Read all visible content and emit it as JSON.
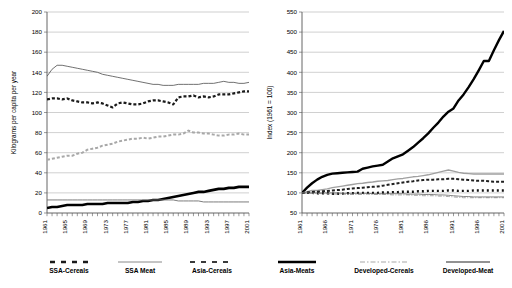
{
  "figure": {
    "background": "#ffffff",
    "panel_count": 2
  },
  "chart_data": [
    {
      "id": "left-chart",
      "type": "line",
      "title": "",
      "xlabel": "",
      "ylabel": "Kilograms per capita per year",
      "xlim": [
        1961,
        2001
      ],
      "ylim": [
        0,
        200
      ],
      "yticks": [
        0,
        20,
        40,
        60,
        80,
        100,
        120,
        140,
        160,
        180,
        200
      ],
      "xticks": [
        1961,
        1965,
        1969,
        1973,
        1977,
        1981,
        1985,
        1989,
        1993,
        1997,
        2001
      ],
      "grid": true,
      "legend_position": "below",
      "x": [
        1961,
        1962,
        1963,
        1964,
        1965,
        1966,
        1967,
        1968,
        1969,
        1970,
        1971,
        1972,
        1973,
        1974,
        1975,
        1976,
        1977,
        1978,
        1979,
        1980,
        1981,
        1982,
        1983,
        1984,
        1985,
        1986,
        1987,
        1988,
        1989,
        1990,
        1991,
        1992,
        1993,
        1994,
        1995,
        1996,
        1997,
        1998,
        1999,
        2000,
        2001
      ],
      "series": [
        {
          "name": "SSA-Cereals",
          "color": "#1a1a1a",
          "style": "dashed-thick",
          "width": 2.2,
          "dash": "3,2",
          "values": [
            113,
            114,
            114,
            113,
            114,
            112,
            111,
            110,
            110,
            109,
            110,
            109,
            107,
            105,
            109,
            110,
            109,
            108,
            108,
            109,
            111,
            112,
            112,
            111,
            110,
            108,
            115,
            116,
            116,
            117,
            115,
            116,
            115,
            116,
            118,
            118,
            118,
            119,
            120,
            121,
            121
          ]
        },
        {
          "name": "SSA Meat",
          "color": "#4d4d4d",
          "style": "solid-thin",
          "width": 0.8,
          "dash": "",
          "values": [
            136,
            143,
            147,
            147,
            146,
            145,
            144,
            143,
            142,
            141,
            140,
            138,
            137,
            136,
            135,
            134,
            133,
            132,
            131,
            130,
            129,
            128,
            128,
            127,
            127,
            127,
            128,
            128,
            128,
            128,
            128,
            129,
            129,
            129,
            130,
            131,
            130,
            130,
            129,
            129,
            130
          ]
        },
        {
          "name": "Asia-Cereals",
          "color": "#a8a8a8",
          "style": "dashed-med",
          "width": 2.0,
          "dash": "3,2",
          "values": [
            53,
            54,
            55,
            56,
            57,
            57,
            59,
            60,
            63,
            64,
            65,
            67,
            68,
            69,
            71,
            72,
            73,
            74,
            74,
            75,
            74,
            75,
            76,
            76,
            77,
            78,
            78,
            79,
            82,
            80,
            80,
            79,
            79,
            78,
            77,
            77,
            78,
            78,
            79,
            78,
            78
          ]
        },
        {
          "name": "Asia-Meats",
          "color": "#000000",
          "style": "solid-verythick",
          "width": 2.6,
          "dash": "",
          "values": [
            5,
            6,
            6,
            7,
            8,
            8,
            8,
            8,
            9,
            9,
            9,
            9,
            10,
            10,
            10,
            10,
            10,
            11,
            11,
            12,
            12,
            13,
            13,
            14,
            15,
            16,
            17,
            18,
            19,
            20,
            21,
            21,
            22,
            23,
            24,
            24,
            25,
            25,
            26,
            26,
            26
          ]
        },
        {
          "name": "Developed-Cereals",
          "color": "#6e6e6e",
          "style": "solid-thin",
          "width": 0.9,
          "dash": "",
          "values": [
            13,
            13,
            13,
            13,
            13,
            13,
            13,
            13,
            13,
            13,
            13,
            13,
            13,
            13,
            13,
            13,
            13,
            13,
            13,
            13,
            13,
            13,
            13,
            13,
            13,
            13,
            12,
            12,
            12,
            12,
            12,
            11,
            11,
            11,
            11,
            11,
            11,
            11,
            11,
            11,
            11
          ]
        }
      ],
      "legend": [
        {
          "label": "SSA-Cereals",
          "color": "#1a1a1a",
          "style": "dashed-thick"
        },
        {
          "label": "SSA Meat",
          "color": "#8a8a8a",
          "style": "solid-thin"
        },
        {
          "label": "Asia-Cereals",
          "color": "#3a3a3a",
          "style": "dashed-med"
        }
      ]
    },
    {
      "id": "right-chart",
      "type": "line",
      "title": "",
      "xlabel": "",
      "ylabel": "Index (1961 = 100)",
      "xlim": [
        1961,
        2001
      ],
      "ylim": [
        50,
        550
      ],
      "yticks": [
        50,
        100,
        150,
        200,
        250,
        300,
        350,
        400,
        450,
        500,
        550
      ],
      "xticks": [
        1961,
        1966,
        1971,
        1976,
        1981,
        1986,
        1991,
        1996,
        2001
      ],
      "grid": true,
      "legend_position": "below",
      "x": [
        1961,
        1962,
        1963,
        1964,
        1965,
        1966,
        1967,
        1968,
        1969,
        1970,
        1971,
        1972,
        1973,
        1974,
        1975,
        1976,
        1977,
        1978,
        1979,
        1980,
        1981,
        1982,
        1983,
        1984,
        1985,
        1986,
        1987,
        1988,
        1989,
        1990,
        1991,
        1992,
        1993,
        1994,
        1995,
        1996,
        1997,
        1998,
        1999,
        2000,
        2001
      ],
      "series": [
        {
          "name": "Asia-Meats",
          "color": "#000000",
          "style": "solid-verythick",
          "width": 2.4,
          "dash": "",
          "values": [
            100,
            113,
            124,
            133,
            140,
            145,
            148,
            149,
            150,
            151,
            152,
            153,
            160,
            163,
            166,
            168,
            170,
            178,
            186,
            191,
            196,
            205,
            214,
            225,
            236,
            248,
            262,
            275,
            290,
            302,
            310,
            330,
            345,
            363,
            383,
            405,
            428,
            428,
            455,
            480,
            503
          ]
        },
        {
          "name": "Developed-Meat",
          "color": "#a0a0a0",
          "style": "solid-med",
          "width": 1.4,
          "dash": "",
          "values": [
            100,
            103,
            106,
            106,
            108,
            110,
            113,
            115,
            117,
            119,
            121,
            123,
            124,
            126,
            127,
            129,
            130,
            131,
            133,
            135,
            136,
            138,
            140,
            141,
            143,
            145,
            148,
            151,
            154,
            157,
            154,
            151,
            149,
            148,
            147,
            147,
            147,
            147,
            147,
            147,
            147
          ]
        },
        {
          "name": "SSA-Cereals",
          "color": "#202020",
          "style": "dashed-thick",
          "width": 2.0,
          "dash": "3,2",
          "values": [
            100,
            101,
            102,
            103,
            104,
            105,
            106,
            107,
            108,
            110,
            111,
            112,
            113,
            114,
            115,
            116,
            118,
            120,
            122,
            124,
            126,
            128,
            129,
            131,
            132,
            133,
            133,
            134,
            134,
            135,
            135,
            134,
            133,
            132,
            131,
            130,
            130,
            129,
            128,
            128,
            128
          ]
        },
        {
          "name": "SSA-Meats",
          "color": "#111111",
          "style": "dashed-sq",
          "width": 2.4,
          "dash": "2,3",
          "values": [
            100,
            100,
            100,
            99,
            99,
            99,
            98,
            98,
            98,
            99,
            99,
            100,
            100,
            100,
            100,
            100,
            101,
            101,
            102,
            102,
            103,
            103,
            103,
            104,
            104,
            105,
            105,
            105,
            105,
            106,
            106,
            105,
            105,
            105,
            106,
            106,
            106,
            106,
            106,
            106,
            106
          ]
        },
        {
          "name": "Developed-Cereals",
          "color": "#9a9a9a",
          "style": "dashdot",
          "width": 0.9,
          "dash": "4,1.5,1,1.5",
          "values": [
            100,
            100,
            99,
            99,
            98,
            98,
            97,
            97,
            97,
            96,
            96,
            96,
            96,
            97,
            96,
            96,
            96,
            96,
            95,
            95,
            95,
            95,
            94,
            94,
            93,
            93,
            93,
            92,
            92,
            91,
            90,
            89,
            88,
            88,
            88,
            88,
            88,
            88,
            88,
            88,
            88
          ]
        },
        {
          "name": "Asia-Cereals",
          "color": "#555555",
          "style": "solid-thin",
          "width": 0.7,
          "dash": "",
          "values": [
            100,
            100,
            100,
            100,
            100,
            100,
            100,
            100,
            99,
            99,
            99,
            99,
            99,
            99,
            98,
            98,
            98,
            98,
            98,
            98,
            98,
            97,
            97,
            97,
            96,
            96,
            96,
            95,
            95,
            94,
            93,
            92,
            91,
            91,
            90,
            90,
            90,
            90,
            90,
            90,
            90
          ]
        }
      ],
      "legend": [
        {
          "label": "Asia-Meats",
          "color": "#000000",
          "style": "solid-verythick"
        },
        {
          "label": "Developed-Cereals",
          "color": "#a8a8a8",
          "style": "dashdot"
        },
        {
          "label": "Developed-Meat",
          "color": "#6e6e6e",
          "style": "solid-med"
        }
      ]
    }
  ]
}
